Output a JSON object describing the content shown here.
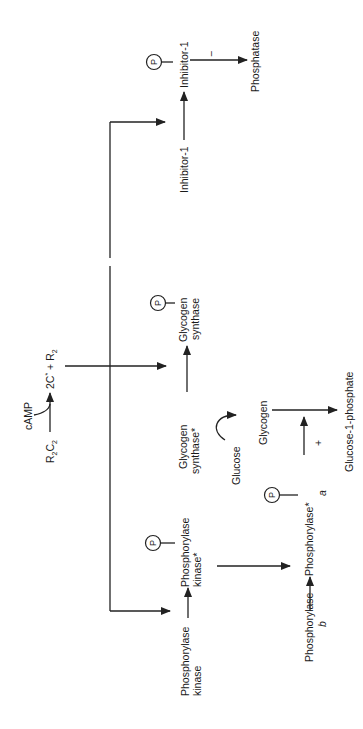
{
  "diagram": {
    "orientation": "rotated 90 degrees counterclockwise",
    "camp_activation": {
      "substrate": "R₂C₂",
      "substrate_main": "R",
      "substrate_sub1": "2",
      "substrate_mid": "C",
      "substrate_sub2": "2",
      "effector": "cAMP",
      "product_prefix": "2C",
      "product_star": "*",
      "product_plus": " + R",
      "product_sub": "2"
    },
    "phosphate_label": "P",
    "inhibitor": {
      "inactive": "Inhibitor-1",
      "active": "Inhibitor-1",
      "effect_sign": "−",
      "target": "Phosphatase"
    },
    "glycogen_synthase": {
      "active_line1": "Glycogen",
      "active_line2": "synthase*",
      "inactive_line1": "Glycogen",
      "inactive_line2": "synthase"
    },
    "phosphorylase_kinase": {
      "inactive_line1": "Phosphorylase",
      "inactive_line2": "kinase",
      "active_line1": "Phosphorylase",
      "active_line2": "kinase*"
    },
    "phosphorylase": {
      "b_line1": "Phosphorylase",
      "b_line2": "b",
      "a_line1": "Phosphorylase*",
      "a_line2": "a",
      "effect_sign": "+"
    },
    "glycogen_synthesis": {
      "glucose": "Glucose",
      "glycogen": "Glycogen",
      "product": "Glucose-1-phosphate"
    }
  }
}
